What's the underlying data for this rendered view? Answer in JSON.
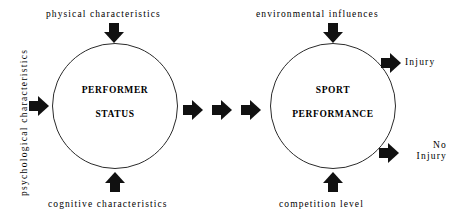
{
  "diagram": {
    "stroke_color": "#2b2b2b",
    "arrow_color": "#111111",
    "background": "#ffffff",
    "nodes": [
      {
        "id": "performer",
        "line1": "PERFORMER",
        "line2": "STATUS"
      },
      {
        "id": "sport",
        "line1": "SPORT",
        "line2": "PERFORMANCE"
      }
    ],
    "inputs": {
      "performer_top": "physical   characteristics",
      "performer_bottom": "cognitive   characteristics",
      "performer_left": "psychological   characteristics",
      "sport_top": "environmental   influences",
      "sport_bottom": "competition   level"
    },
    "outcomes": [
      {
        "id": "injury",
        "label": "Injury"
      },
      {
        "id": "no-injury",
        "label_line1": "No",
        "label_line2": "Injury"
      }
    ],
    "connector": {
      "id": "performer-to-sport",
      "arrow_count": 3,
      "direction": "right"
    }
  }
}
